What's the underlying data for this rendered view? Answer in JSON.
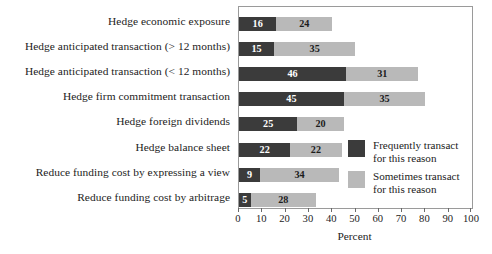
{
  "chart_data": {
    "type": "bar",
    "orientation": "horizontal",
    "stacked": true,
    "title": "",
    "xlabel": "Percent",
    "ylabel": "",
    "xlim": [
      0,
      100
    ],
    "xticks": [
      0,
      10,
      20,
      30,
      40,
      50,
      60,
      70,
      80,
      90,
      100
    ],
    "grid": false,
    "legend_position": "inside-right",
    "categories": [
      "Hedge economic exposure",
      "Hedge anticipated transaction (> 12 months)",
      "Hedge anticipated transaction (< 12 months)",
      "Hedge firm commitment transaction",
      "Hedge foreign dividends",
      "Hedge balance sheet",
      "Reduce funding cost by expressing a view",
      "Reduce funding cost by arbitrage"
    ],
    "series": [
      {
        "name": "Frequently transact\nfor this reason",
        "color": "#3b3b3b",
        "values": [
          16,
          15,
          46,
          45,
          25,
          22,
          9,
          5
        ]
      },
      {
        "name": "Sometimes transact\nfor this reason",
        "color": "#b9b9b9",
        "values": [
          24,
          35,
          31,
          35,
          20,
          22,
          34,
          28
        ]
      }
    ],
    "totals": [
      40,
      50,
      77,
      80,
      45,
      44,
      43,
      33
    ]
  },
  "legend": {
    "items": [
      {
        "label": "Frequently transact\nfor this reason",
        "swatch": "dark"
      },
      {
        "label": "Sometimes transact\nfor this reason",
        "swatch": "light"
      }
    ]
  },
  "axis": {
    "x_title": "Percent"
  }
}
